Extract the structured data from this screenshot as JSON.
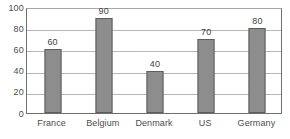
{
  "chart_data": {
    "type": "bar",
    "title": "",
    "subtitle": "",
    "xlabel": "",
    "ylabel": "",
    "categories": [
      "France",
      "Belgium",
      "Denmark",
      "US",
      "Germany"
    ],
    "values": [
      60,
      90,
      40,
      70,
      80
    ],
    "value_labels": [
      "60",
      "90",
      "40",
      "70",
      "80"
    ],
    "ylim": [
      0,
      100
    ],
    "ytick_labels": [
      "0",
      "20",
      "40",
      "60",
      "80",
      "100"
    ],
    "ytick_values": [
      0,
      20,
      40,
      60,
      80,
      100
    ],
    "grid": true,
    "grid_axis": "y",
    "legend": false,
    "legend_position": "none",
    "colors": {
      "bar_fill": "#8d8d8d",
      "bar_border": "#5d5d5d",
      "gridline": "#b6b6b6",
      "axis": "#6f6f6f",
      "text": "#4d4d4d",
      "value_text": "#3f3f3f",
      "background": "#ffffff"
    }
  }
}
